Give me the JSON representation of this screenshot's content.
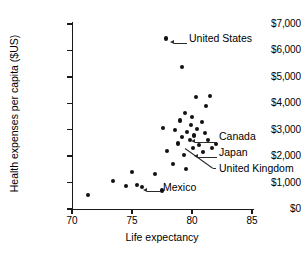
{
  "chart_data": {
    "type": "scatter",
    "title": "",
    "xlabel": "Life expectancy",
    "ylabel": "Health expenses per capita ($US)",
    "xlim": [
      70,
      85
    ],
    "ylim": [
      0,
      7000
    ],
    "xticks": [
      70,
      75,
      80,
      85
    ],
    "xtick_labels": [
      "70",
      "75",
      "80",
      "85"
    ],
    "yticks": [
      0,
      1000,
      2000,
      3000,
      4000,
      5000,
      6000,
      7000
    ],
    "ytick_labels": [
      "$0",
      "$1,000",
      "$2,000",
      "$3,000",
      "$4,000",
      "$5,000",
      "$6,000",
      "$7,000"
    ],
    "grid": false,
    "legend": "none",
    "marker": "filled-circle",
    "marker_color": "#111111",
    "points": [
      {
        "x": 71.3,
        "y": 530,
        "label": ""
      },
      {
        "x": 73.4,
        "y": 1060,
        "label": ""
      },
      {
        "x": 74.5,
        "y": 870,
        "label": ""
      },
      {
        "x": 75.0,
        "y": 1400,
        "label": ""
      },
      {
        "x": 75.4,
        "y": 900,
        "label": "Mexico"
      },
      {
        "x": 75.8,
        "y": 830,
        "label": ""
      },
      {
        "x": 76.9,
        "y": 1320,
        "label": ""
      },
      {
        "x": 77.5,
        "y": 700,
        "label": ""
      },
      {
        "x": 77.6,
        "y": 3050,
        "label": ""
      },
      {
        "x": 77.9,
        "y": 2180,
        "label": ""
      },
      {
        "x": 77.8,
        "y": 6450,
        "label": "United States"
      },
      {
        "x": 78.4,
        "y": 1700,
        "label": ""
      },
      {
        "x": 78.6,
        "y": 2980,
        "label": ""
      },
      {
        "x": 78.8,
        "y": 2480,
        "label": ""
      },
      {
        "x": 79.0,
        "y": 3350,
        "label": ""
      },
      {
        "x": 79.2,
        "y": 2720,
        "label": ""
      },
      {
        "x": 79.3,
        "y": 2050,
        "label": ""
      },
      {
        "x": 79.4,
        "y": 3620,
        "label": ""
      },
      {
        "x": 79.5,
        "y": 1520,
        "label": ""
      },
      {
        "x": 79.6,
        "y": 2900,
        "label": ""
      },
      {
        "x": 79.8,
        "y": 2600,
        "label": ""
      },
      {
        "x": 79.9,
        "y": 3180,
        "label": ""
      },
      {
        "x": 80.0,
        "y": 3480,
        "label": ""
      },
      {
        "x": 80.1,
        "y": 2300,
        "label": ""
      },
      {
        "x": 80.2,
        "y": 2780,
        "label": ""
      },
      {
        "x": 80.3,
        "y": 4230,
        "label": ""
      },
      {
        "x": 80.4,
        "y": 3040,
        "label": ""
      },
      {
        "x": 80.6,
        "y": 2420,
        "label": "United Kingdom"
      },
      {
        "x": 80.8,
        "y": 3300,
        "label": ""
      },
      {
        "x": 80.9,
        "y": 2150,
        "label": ""
      },
      {
        "x": 81.1,
        "y": 2880,
        "label": ""
      },
      {
        "x": 81.2,
        "y": 3900,
        "label": ""
      },
      {
        "x": 81.3,
        "y": 2620,
        "label": "Canada"
      },
      {
        "x": 81.5,
        "y": 4280,
        "label": ""
      },
      {
        "x": 81.7,
        "y": 2300,
        "label": "Japan"
      },
      {
        "x": 82.0,
        "y": 2460,
        "label": ""
      },
      {
        "x": 79.2,
        "y": 5370,
        "label": ""
      }
    ],
    "annotations": [
      {
        "text": "United States",
        "point_x": 77.8,
        "point_y": 6450
      },
      {
        "text": "Canada",
        "point_x": 81.3,
        "point_y": 2620
      },
      {
        "text": "Japan",
        "point_x": 81.7,
        "point_y": 2300
      },
      {
        "text": "United Kingdom",
        "point_x": 80.6,
        "point_y": 2420
      },
      {
        "text": "Mexico",
        "point_x": 75.4,
        "point_y": 900
      }
    ]
  }
}
